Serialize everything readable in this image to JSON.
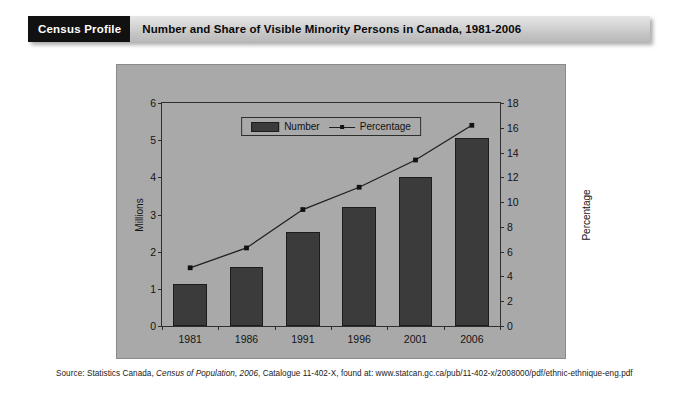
{
  "header": {
    "tag": "Census Profile",
    "title": "Number and Share of Visible Minority Persons in Canada, 1981-2006"
  },
  "source": {
    "prefix": "Source: Statistics Canada, ",
    "italic": "Census of Population, 2006",
    "suffix": ", Catalogue 11-402-X, found at: www.statcan.gc.ca/pub/11-402-x/2008000/pdf/ethnic-ethnique-eng.pdf"
  },
  "legend": {
    "number_label": "Number",
    "percentage_label": "Percentage"
  },
  "colors": {
    "panel_bg": "#a9a9a9",
    "bar_fill": "#3b3b3b",
    "bar_stroke": "#1c1c1c",
    "line": "#202020",
    "axis": "#2e2e2e",
    "header_tag_bg": "#111111",
    "header_title_bg": "#d2d2d2"
  },
  "chart_data": {
    "type": "bar",
    "title": "Number and Share of Visible Minority Persons in Canada, 1981-2006",
    "xlabel": "",
    "categories": [
      "1981",
      "1986",
      "1991",
      "1996",
      "2001",
      "2006"
    ],
    "grid": false,
    "legend_position": "top-center",
    "series": [
      {
        "name": "Number",
        "type": "bar",
        "axis": "left",
        "unit": "Millions",
        "values": [
          1.13,
          1.58,
          2.52,
          3.19,
          4.02,
          5.07
        ]
      },
      {
        "name": "Percentage",
        "type": "line",
        "axis": "right",
        "unit": "Percentage",
        "values": [
          4.7,
          6.3,
          9.4,
          11.2,
          13.4,
          16.2
        ]
      }
    ],
    "y_left": {
      "label": "Millions",
      "ylim": [
        0,
        6
      ],
      "ticks": [
        "0",
        "1",
        "2",
        "3",
        "4",
        "5",
        "6"
      ],
      "tick_values": [
        0,
        1,
        2,
        3,
        4,
        5,
        6
      ]
    },
    "y_right": {
      "label": "Percentage",
      "ylim": [
        0,
        18
      ],
      "ticks": [
        "0",
        "2",
        "4",
        "6",
        "8",
        "10",
        "12",
        "14",
        "16",
        "18"
      ],
      "tick_values": [
        0,
        2,
        4,
        6,
        8,
        10,
        12,
        14,
        16,
        18
      ]
    }
  }
}
